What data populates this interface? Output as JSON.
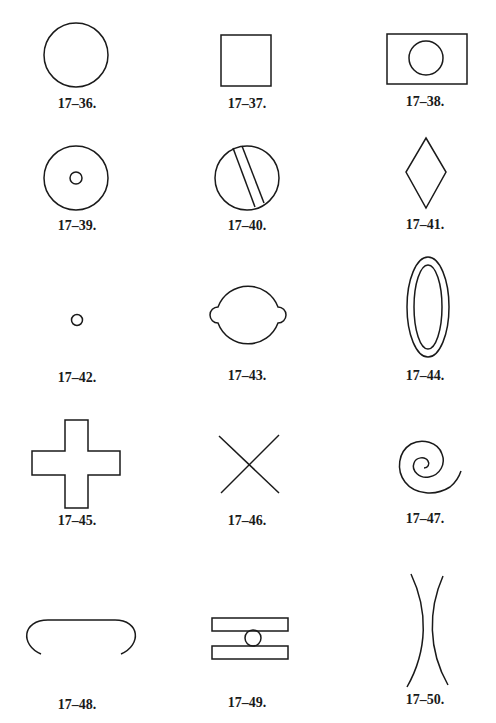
{
  "figures": [
    {
      "id": "17-36",
      "label": "17–36.",
      "shape": "circle"
    },
    {
      "id": "17-37",
      "label": "17–37.",
      "shape": "square"
    },
    {
      "id": "17-38",
      "label": "17–38.",
      "shape": "rectangle-with-circle"
    },
    {
      "id": "17-39",
      "label": "17–39.",
      "shape": "circle-with-center-dot"
    },
    {
      "id": "17-40",
      "label": "17–40.",
      "shape": "circle-with-diagonal-band"
    },
    {
      "id": "17-41",
      "label": "17–41.",
      "shape": "diamond"
    },
    {
      "id": "17-42",
      "label": "17–42.",
      "shape": "small-circle"
    },
    {
      "id": "17-43",
      "label": "17–43.",
      "shape": "circle-with-side-lobes"
    },
    {
      "id": "17-44",
      "label": "17–44.",
      "shape": "double-ellipse"
    },
    {
      "id": "17-45",
      "label": "17–45.",
      "shape": "cross"
    },
    {
      "id": "17-46",
      "label": "17–46.",
      "shape": "x-lines"
    },
    {
      "id": "17-47",
      "label": "17–47.",
      "shape": "spiral"
    },
    {
      "id": "17-48",
      "label": "17–48.",
      "shape": "open-arch"
    },
    {
      "id": "17-49",
      "label": "17–49.",
      "shape": "two-bars-with-circle"
    },
    {
      "id": "17-50",
      "label": "17–50.",
      "shape": "two-facing-arcs"
    }
  ],
  "colors": {
    "stroke": "#1a1a1a",
    "background": "#ffffff"
  }
}
